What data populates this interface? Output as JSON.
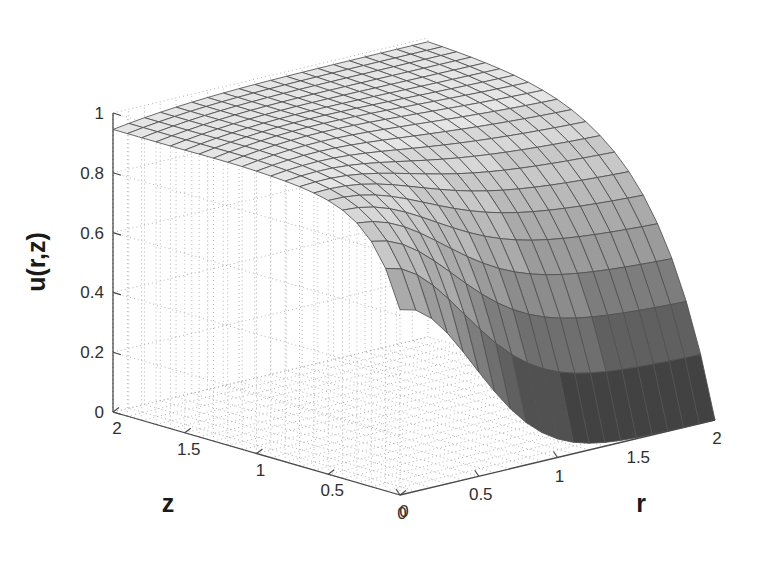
{
  "figure": {
    "background": "#ffffff",
    "type": "matlab-surface-plot"
  },
  "axes": {
    "x": {
      "name": "r",
      "label": "r",
      "ticks": [
        0,
        0.5,
        1,
        1.5,
        2
      ],
      "tick_labels": [
        "0",
        "0.5",
        "1",
        "1.5",
        "2"
      ],
      "range": [
        0,
        2
      ]
    },
    "y": {
      "name": "z",
      "label": "z",
      "ticks": [
        0,
        0.5,
        1,
        1.5,
        2
      ],
      "tick_labels": [
        "0",
        "0.5",
        "1",
        "1.5",
        "2"
      ],
      "range": [
        0,
        2
      ]
    },
    "z": {
      "name": "u",
      "label": "u(r,z)",
      "ticks": [
        0,
        0.2,
        0.4,
        0.6,
        0.8,
        1
      ],
      "tick_labels": [
        "0",
        "0.2",
        "0.4",
        "0.6",
        "0.8",
        "1"
      ],
      "range": [
        0,
        1
      ]
    }
  },
  "colors": {
    "surface_light": "#e0e0e0",
    "surface_dark": "#3c3c3c",
    "mesh_line": "#505050",
    "axis_line": "#4a4a4a",
    "grid_line": "#b4b4b4",
    "text": "#303030"
  },
  "chart_data": {
    "type": "surface",
    "title": "",
    "xlabel": "r",
    "ylabel": "z",
    "zlabel": "u(r,z)",
    "xlim": [
      0,
      2
    ],
    "ylim": [
      0,
      2
    ],
    "zlim": [
      0,
      1
    ],
    "grid": true,
    "colormap": "gray",
    "view_azimuth": -37.5,
    "view_elevation": 30,
    "nx": 21,
    "ny": 21,
    "x": [
      0,
      0.1,
      0.2,
      0.3,
      0.4,
      0.5,
      0.6,
      0.7,
      0.8,
      0.9,
      1.0,
      1.1,
      1.2,
      1.3,
      1.4,
      1.5,
      1.6,
      1.7,
      1.8,
      1.9,
      2.0
    ],
    "y": [
      0,
      0.1,
      0.2,
      0.3,
      0.4,
      0.5,
      0.6,
      0.7,
      0.8,
      0.9,
      1.0,
      1.1,
      1.2,
      1.3,
      1.4,
      1.5,
      1.6,
      1.7,
      1.8,
      1.9,
      2.0
    ],
    "z_surface_note": "Computed in template from the analytic model u(r,z) = (1 - exp(-a*z)) blended with a radial profile; tabulated sample below.",
    "samples": [
      {
        "r": 0.0,
        "z": 0.0,
        "u": 0.6
      },
      {
        "r": 0.0,
        "z": 0.5,
        "u": 0.9
      },
      {
        "r": 0.0,
        "z": 1.0,
        "u": 0.94
      },
      {
        "r": 0.0,
        "z": 1.5,
        "u": 0.95
      },
      {
        "r": 0.0,
        "z": 2.0,
        "u": 0.95
      },
      {
        "r": 0.5,
        "z": 0.0,
        "u": 0.3
      },
      {
        "r": 0.5,
        "z": 0.5,
        "u": 0.82
      },
      {
        "r": 0.5,
        "z": 1.0,
        "u": 0.93
      },
      {
        "r": 0.5,
        "z": 2.0,
        "u": 0.96
      },
      {
        "r": 1.0,
        "z": 0.0,
        "u": 0.1
      },
      {
        "r": 1.0,
        "z": 0.5,
        "u": 0.7
      },
      {
        "r": 1.0,
        "z": 1.0,
        "u": 0.92
      },
      {
        "r": 1.0,
        "z": 2.0,
        "u": 0.99
      },
      {
        "r": 1.5,
        "z": 0.0,
        "u": 0.03
      },
      {
        "r": 1.5,
        "z": 0.5,
        "u": 0.62
      },
      {
        "r": 1.5,
        "z": 1.0,
        "u": 0.93
      },
      {
        "r": 1.5,
        "z": 2.0,
        "u": 1.0
      },
      {
        "r": 2.0,
        "z": 0.0,
        "u": 0.0
      },
      {
        "r": 2.0,
        "z": 0.5,
        "u": 0.58
      },
      {
        "r": 2.0,
        "z": 1.0,
        "u": 0.94
      },
      {
        "r": 2.0,
        "z": 2.0,
        "u": 1.0
      }
    ]
  }
}
